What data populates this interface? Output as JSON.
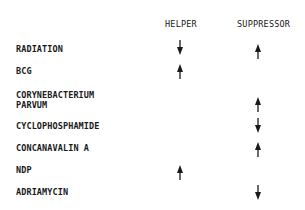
{
  "columns": {
    "helper": "HELPER",
    "suppressor": "SUPPRESSOR"
  },
  "rows": [
    {
      "label": "RADIATION",
      "helper": "down",
      "suppressor": "up"
    },
    {
      "label": "BCG",
      "helper": "up",
      "suppressor": ""
    },
    {
      "label": "CORYNEBACTERIUM\nPARVUM",
      "helper": "",
      "suppressor": "up"
    },
    {
      "label": "CYCLOPHOSPHAMIDE",
      "helper": "",
      "suppressor": "down"
    },
    {
      "label": "CONCANAVALIN A",
      "helper": "",
      "suppressor": "up"
    },
    {
      "label": "NDP",
      "helper": "up",
      "suppressor": ""
    },
    {
      "label": "ADRIAMYCIN",
      "helper": "",
      "suppressor": "down"
    }
  ],
  "icons": {
    "up": "arrow-up-icon",
    "down": "arrow-down-icon"
  }
}
